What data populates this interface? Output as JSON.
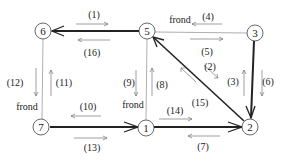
{
  "diagram": {
    "title": "",
    "nodes": [
      {
        "id": "6",
        "label": "6",
        "x": 43,
        "y": 31
      },
      {
        "id": "5",
        "label": "5",
        "x": 147,
        "y": 31
      },
      {
        "id": "3",
        "label": "3",
        "x": 255,
        "y": 33
      },
      {
        "id": "7",
        "label": "7",
        "x": 41,
        "y": 127
      },
      {
        "id": "1",
        "label": "1",
        "x": 146,
        "y": 128
      },
      {
        "id": "2",
        "label": "2",
        "x": 250,
        "y": 127
      }
    ],
    "edges": [
      {
        "from": "5",
        "to": "6",
        "type": "tree",
        "style": "thick-arrow"
      },
      {
        "from": "3",
        "to": "5",
        "type": "frond",
        "style": "thin"
      },
      {
        "from": "2",
        "to": "5",
        "type": "tree",
        "style": "thick-arrow"
      },
      {
        "from": "3",
        "to": "2",
        "type": "tree",
        "style": "thick-arrow"
      },
      {
        "from": "7",
        "to": "1",
        "type": "tree",
        "style": "thick-arrow"
      },
      {
        "from": "1",
        "to": "2",
        "type": "tree",
        "style": "thick-arrow"
      },
      {
        "from": "6",
        "to": "7",
        "type": "frond",
        "style": "thin"
      },
      {
        "from": "5",
        "to": "1",
        "type": "frond",
        "style": "thin"
      }
    ],
    "traversal_labels": [
      {
        "label": "(1)",
        "x": 94,
        "y": 18
      },
      {
        "label": "(16)",
        "x": 92,
        "y": 56
      },
      {
        "label": "(4)",
        "x": 208,
        "y": 20
      },
      {
        "label": "(5)",
        "x": 207,
        "y": 55
      },
      {
        "label": "(2)",
        "x": 210,
        "y": 70
      },
      {
        "label": "(3)",
        "x": 233,
        "y": 85
      },
      {
        "label": "(6)",
        "x": 268,
        "y": 85
      },
      {
        "label": "(9)",
        "x": 129,
        "y": 86
      },
      {
        "label": "(8)",
        "x": 162,
        "y": 88
      },
      {
        "label": "(15)",
        "x": 200,
        "y": 106
      },
      {
        "label": "(12)",
        "x": 15,
        "y": 86
      },
      {
        "label": "(11)",
        "x": 56,
        "y": 86
      },
      {
        "label": "(10)",
        "x": 88,
        "y": 110
      },
      {
        "label": "(13)",
        "x": 92,
        "y": 151
      },
      {
        "label": "(14)",
        "x": 175,
        "y": 114
      },
      {
        "label": "(7)",
        "x": 203,
        "y": 150
      }
    ],
    "frond_labels": [
      {
        "label": "frond",
        "x": 180,
        "y": 23
      },
      {
        "label": "frond",
        "x": 27,
        "y": 110
      },
      {
        "label": "frond",
        "x": 133,
        "y": 108
      }
    ],
    "colors": {
      "stroke": "#222222",
      "thin_stroke": "#888888",
      "background": "#ffffff"
    }
  }
}
